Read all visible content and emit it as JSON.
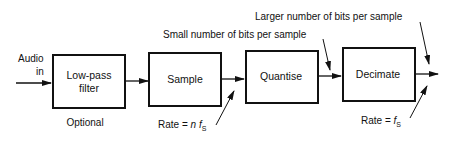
{
  "diagram": {
    "input_label_line1": "Audio",
    "input_label_line2": "in",
    "blocks": [
      {
        "line1": "Low-pass",
        "line2": "filter"
      },
      {
        "line1": "Sample"
      },
      {
        "line1": "Quantise"
      },
      {
        "line1": "Decimate"
      }
    ],
    "optional_label": "Optional",
    "rate_sample_prefix": "Rate = ",
    "rate_sample_n": "n",
    "rate_sample_f": "f",
    "rate_sample_sub": "S",
    "rate_out_prefix": "Rate = ",
    "rate_out_f": "f",
    "rate_out_sub": "S",
    "small_bits_label": "Small number of bits per sample",
    "larger_bits_label": "Larger number of bits per sample"
  }
}
